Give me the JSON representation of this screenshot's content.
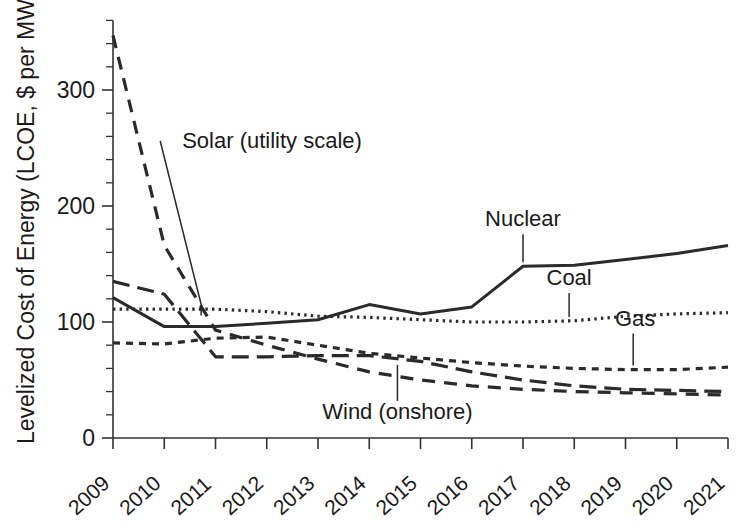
{
  "chart_data": {
    "type": "line",
    "title": "",
    "xlabel": "",
    "ylabel": "Levelized Cost of Energy (LCOE, $ per MWh)",
    "x": [
      2009,
      2010,
      2011,
      2012,
      2013,
      2014,
      2015,
      2016,
      2017,
      2018,
      2019,
      2020,
      2021
    ],
    "categories": [
      "2009",
      "2010",
      "2011",
      "2012",
      "2013",
      "2014",
      "2015",
      "2016",
      "2017",
      "2018",
      "2019",
      "2020",
      "2021"
    ],
    "ylim": [
      0,
      360
    ],
    "xlim": [
      2009,
      2021
    ],
    "y_ticks": [
      0,
      100,
      200,
      300
    ],
    "y_tick_labels": [
      "0",
      "100",
      "200",
      "300"
    ],
    "y_minor_step": 20,
    "grid": false,
    "legend_position": "inline-annotations",
    "series": [
      {
        "name": "Solar (utility scale)",
        "style": "dashed",
        "dash": "13,9",
        "width": 3.2,
        "label_x": 2010.45,
        "label_y": 250,
        "values": [
          347,
          166,
          93,
          80,
          68,
          57,
          50,
          45,
          42,
          40,
          39,
          38,
          37
        ]
      },
      {
        "name": "Nuclear",
        "style": "solid",
        "dash": "",
        "width": 3.0,
        "label_x": 2016.7,
        "label_y": 180,
        "values": [
          121,
          96,
          96,
          99,
          102,
          115,
          107,
          113,
          148,
          149,
          154,
          159,
          166
        ]
      },
      {
        "name": "Coal",
        "style": "dotted",
        "dash": "2.4,4.2",
        "width": 3.2,
        "label_x": 2017.25,
        "label_y": 133,
        "values": [
          111,
          111,
          111,
          109,
          105,
          104,
          102,
          100,
          100,
          101,
          105,
          107,
          108
        ]
      },
      {
        "name": "Gas",
        "style": "short-dash",
        "dash": "7,6",
        "width": 3.2,
        "label_x": 2018.85,
        "label_y": 92,
        "values": [
          82,
          81,
          86,
          87,
          80,
          73,
          69,
          65,
          62,
          60,
          59,
          59,
          61
        ]
      },
      {
        "name": "Wind (onshore)",
        "style": "long-dash",
        "dash": "17,8",
        "width": 3.2,
        "label_x": 2012.0,
        "label_y": 33,
        "values": [
          135,
          124,
          70,
          70,
          71,
          71,
          66,
          57,
          50,
          45,
          42,
          41,
          40
        ]
      }
    ],
    "annotations": [
      {
        "text": "Solar (utility scale)",
        "series": "Solar (utility scale)"
      },
      {
        "text": "Nuclear",
        "series": "Nuclear"
      },
      {
        "text": "Coal",
        "series": "Coal"
      },
      {
        "text": "Gas",
        "series": "Gas"
      },
      {
        "text": "Wind (onshore)",
        "series": "Wind (onshore)"
      }
    ]
  },
  "axis": {
    "y_label": "Levelized Cost of Energy (LCOE, $ per MWh)",
    "y_tick_0": "0",
    "y_tick_1": "100",
    "y_tick_2": "200",
    "y_tick_3": "300",
    "x_tick_0": "2009",
    "x_tick_1": "2010",
    "x_tick_2": "2011",
    "x_tick_3": "2012",
    "x_tick_4": "2013",
    "x_tick_5": "2014",
    "x_tick_6": "2015",
    "x_tick_7": "2016",
    "x_tick_8": "2017",
    "x_tick_9": "2018",
    "x_tick_10": "2019",
    "x_tick_11": "2020",
    "x_tick_12": "2021"
  },
  "labels": {
    "solar": "Solar (utility scale)",
    "nuclear": "Nuclear",
    "coal": "Coal",
    "gas": "Gas",
    "wind": "Wind (onshore)"
  },
  "colors": {
    "ink": "#2a2a2a",
    "background": "#ffffff"
  }
}
